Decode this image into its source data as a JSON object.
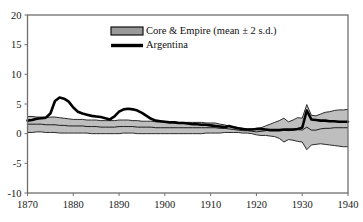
{
  "figure": {
    "width": 363,
    "height": 222,
    "background": "#ffffff"
  },
  "colors": {
    "band_fill": "#b9b9b9",
    "band_edge": "#2b2b2b",
    "series_line": "#000000",
    "frame": "#6f6f6f",
    "text": "#1a1a1a"
  },
  "chart_data": {
    "type": "line",
    "title": "",
    "xlabel": "",
    "ylabel": "",
    "xlim": [
      1870,
      1940
    ],
    "ylim": [
      -10,
      20
    ],
    "grid": false,
    "legend_position": "top-center",
    "x_ticks": [
      1870,
      1880,
      1890,
      1900,
      1910,
      1920,
      1930,
      1940
    ],
    "x_tick_labels": [
      "1870",
      "1880",
      "1890",
      "1900",
      "1910",
      "1920",
      "1930",
      "1940"
    ],
    "y_ticks": [
      -10,
      -5,
      0,
      5,
      10,
      15,
      20
    ],
    "y_tick_labels": [
      "-10",
      "-5",
      "0",
      "5",
      "10",
      "15",
      "20"
    ],
    "legend": [
      {
        "label": "Core & Empire (mean ± 2 s.d.)",
        "marker": "band"
      },
      {
        "label": "Argentina",
        "marker": "line"
      }
    ],
    "x": [
      1870,
      1871,
      1872,
      1873,
      1874,
      1875,
      1876,
      1877,
      1878,
      1879,
      1880,
      1881,
      1882,
      1883,
      1884,
      1885,
      1886,
      1887,
      1888,
      1889,
      1890,
      1891,
      1892,
      1893,
      1894,
      1895,
      1896,
      1897,
      1898,
      1899,
      1900,
      1901,
      1902,
      1903,
      1904,
      1905,
      1906,
      1907,
      1908,
      1909,
      1910,
      1911,
      1912,
      1913,
      1914,
      1915,
      1916,
      1917,
      1918,
      1919,
      1920,
      1921,
      1922,
      1923,
      1924,
      1925,
      1926,
      1927,
      1928,
      1929,
      1930,
      1931,
      1932,
      1933,
      1934,
      1935,
      1936,
      1937,
      1938,
      1939,
      1940
    ],
    "series": [
      {
        "name": "Argentina",
        "type": "line",
        "values": [
          2.2,
          2.3,
          2.5,
          2.6,
          2.7,
          3.4,
          5.5,
          6.1,
          5.9,
          5.4,
          4.4,
          3.7,
          3.4,
          3.2,
          3.0,
          2.9,
          2.8,
          2.6,
          2.4,
          2.9,
          3.7,
          4.1,
          4.2,
          4.1,
          3.9,
          3.5,
          3.0,
          2.5,
          2.2,
          2.1,
          2.0,
          1.9,
          1.9,
          1.8,
          1.8,
          1.7,
          1.6,
          1.6,
          1.5,
          1.5,
          1.4,
          1.3,
          1.2,
          1.1,
          1.3,
          1.1,
          0.9,
          0.8,
          0.7,
          0.7,
          0.8,
          0.8,
          0.7,
          0.6,
          0.6,
          0.6,
          0.7,
          0.7,
          0.7,
          0.8,
          1.0,
          3.9,
          2.4,
          2.3,
          2.2,
          2.2,
          2.1,
          2.1,
          2.0,
          2.0,
          2.0
        ]
      },
      {
        "name": "Core & Empire mean",
        "type": "line",
        "values": [
          1.6,
          1.6,
          1.6,
          1.6,
          1.5,
          1.5,
          1.5,
          1.4,
          1.4,
          1.3,
          1.3,
          1.3,
          1.3,
          1.2,
          1.2,
          1.2,
          1.1,
          1.1,
          1.1,
          1.1,
          1.2,
          1.2,
          1.2,
          1.2,
          1.1,
          1.1,
          1.1,
          1.1,
          1.0,
          1.0,
          1.0,
          1.0,
          1.0,
          1.0,
          1.0,
          1.0,
          1.0,
          1.0,
          1.0,
          1.0,
          1.0,
          1.0,
          0.9,
          0.9,
          0.8,
          0.7,
          0.6,
          0.5,
          0.5,
          0.4,
          0.3,
          0.4,
          0.5,
          0.6,
          0.7,
          0.7,
          0.6,
          0.5,
          0.6,
          0.7,
          0.6,
          1.1,
          0.6,
          0.6,
          0.8,
          0.9,
          0.9,
          1.0,
          1.0,
          1.0,
          1.0
        ]
      },
      {
        "name": "Core & Empire upper (mean + 2 s.d.)",
        "type": "line",
        "values": [
          2.9,
          2.9,
          2.8,
          2.8,
          2.7,
          2.8,
          2.8,
          2.7,
          2.6,
          2.5,
          2.4,
          2.4,
          2.4,
          2.3,
          2.3,
          2.3,
          2.2,
          2.2,
          2.2,
          2.2,
          2.3,
          2.3,
          2.3,
          2.2,
          2.2,
          2.1,
          2.1,
          2.1,
          2.0,
          2.0,
          2.0,
          2.0,
          2.0,
          1.9,
          1.9,
          1.9,
          1.9,
          1.9,
          1.9,
          1.8,
          1.8,
          1.8,
          1.6,
          1.5,
          1.3,
          1.1,
          1.0,
          0.9,
          0.8,
          0.8,
          0.8,
          1.0,
          1.3,
          1.6,
          1.9,
          2.2,
          2.6,
          2.0,
          2.3,
          2.7,
          2.6,
          4.9,
          3.1,
          3.0,
          3.3,
          3.6,
          3.7,
          3.9,
          4.0,
          4.0,
          4.1
        ]
      },
      {
        "name": "Core & Empire lower (mean - 2 s.d.)",
        "type": "line",
        "values": [
          0.2,
          0.2,
          0.3,
          0.3,
          0.2,
          0.2,
          0.2,
          0.1,
          0.1,
          0.1,
          0.1,
          0.1,
          0.1,
          0.1,
          0.0,
          0.0,
          0.0,
          0.0,
          0.0,
          0.0,
          0.0,
          0.1,
          0.1,
          0.1,
          0.0,
          0.0,
          0.0,
          0.0,
          0.0,
          0.0,
          0.0,
          0.0,
          0.0,
          0.0,
          0.0,
          0.0,
          0.0,
          0.0,
          0.0,
          0.1,
          0.1,
          0.1,
          0.1,
          0.2,
          0.2,
          0.2,
          0.2,
          0.1,
          0.1,
          0.0,
          -0.2,
          -0.3,
          -0.3,
          -0.4,
          -0.5,
          -0.8,
          -1.4,
          -1.0,
          -1.1,
          -1.3,
          -1.4,
          -2.7,
          -1.9,
          -1.8,
          -1.7,
          -1.8,
          -1.9,
          -2.0,
          -2.1,
          -2.2,
          -2.2
        ]
      }
    ]
  }
}
